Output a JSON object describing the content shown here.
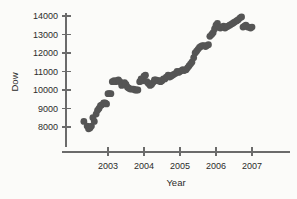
{
  "chart_data": {
    "type": "scatter",
    "title": "",
    "xlabel": "Year",
    "ylabel": "Dow",
    "xlim": [
      2002.25,
      2007.15
    ],
    "ylim": [
      7400,
      14350
    ],
    "grid": false,
    "legend": "none",
    "marker": {
      "shape": "circle",
      "color": "#555555",
      "size": 3.4
    },
    "xticks": [
      2003,
      2004,
      2005,
      2006,
      2007
    ],
    "xtick_labels": [
      "2003",
      "2004",
      "2005",
      "2006",
      "2007"
    ],
    "yticks": [
      8000,
      9000,
      10000,
      11000,
      12000,
      13000,
      14000
    ],
    "ytick_labels": [
      "8000",
      "9000",
      "10000",
      "11000",
      "12000",
      "13000",
      "14000"
    ],
    "series": [
      {
        "name": "Dow Jones monthly close",
        "x": [
          2002.33,
          2002.42,
          2002.46,
          2002.5,
          2002.54,
          2002.58,
          2002.62,
          2002.67,
          2002.71,
          2002.75,
          2002.79,
          2002.83,
          2002.88,
          2002.92,
          2002.96,
          2003.0,
          2003.04,
          2003.08,
          2003.12,
          2003.17,
          2003.21,
          2003.25,
          2003.29,
          2003.33,
          2003.38,
          2003.42,
          2003.46,
          2003.5,
          2003.54,
          2003.58,
          2003.62,
          2003.67,
          2003.71,
          2003.75,
          2003.79,
          2003.83,
          2003.88,
          2003.92,
          2003.96,
          2004.0,
          2004.04,
          2004.08,
          2004.12,
          2004.17,
          2004.21,
          2004.25,
          2004.29,
          2004.33,
          2004.38,
          2004.42,
          2004.46,
          2004.5,
          2004.54,
          2004.58,
          2004.62,
          2004.67,
          2004.71,
          2004.75,
          2004.79,
          2004.83,
          2004.88,
          2004.92,
          2004.96,
          2005.0,
          2005.04,
          2005.08,
          2005.12,
          2005.17,
          2005.21,
          2005.25,
          2005.29,
          2005.33,
          2005.38,
          2005.42,
          2005.46,
          2005.5,
          2005.54,
          2005.58,
          2005.62,
          2005.67,
          2005.71,
          2005.75,
          2005.79,
          2005.83,
          2005.88,
          2005.92,
          2005.96,
          2006.0,
          2006.04,
          2006.08,
          2006.12,
          2006.17,
          2006.21,
          2006.25,
          2006.29,
          2006.33,
          2006.38,
          2006.42,
          2006.46,
          2006.5,
          2006.54,
          2006.58,
          2006.62,
          2006.67,
          2006.71,
          2006.75,
          2006.79,
          2006.83,
          2006.88,
          2006.92,
          2006.96,
          2007.0
        ],
        "y": [
          8300,
          8050,
          7900,
          7950,
          8050,
          8500,
          8300,
          8700,
          8900,
          9000,
          9150,
          9200,
          9300,
          9300,
          9250,
          9800,
          9800,
          9800,
          10450,
          10500,
          10450,
          10500,
          10550,
          10450,
          10250,
          10300,
          10400,
          10300,
          10150,
          10100,
          10050,
          10050,
          10050,
          10000,
          10000,
          10000,
          10450,
          10600,
          10500,
          10750,
          10800,
          10450,
          10350,
          10250,
          10300,
          10400,
          10550,
          10550,
          10500,
          10500,
          10450,
          10500,
          10600,
          10600,
          10700,
          10800,
          10700,
          10750,
          10800,
          10850,
          10900,
          11000,
          10950,
          11000,
          11050,
          11100,
          11050,
          11100,
          11200,
          11300,
          11400,
          11500,
          11750,
          12000,
          12100,
          12200,
          12300,
          12350,
          12400,
          12400,
          12350,
          12400,
          12450,
          12900,
          13000,
          13100,
          13300,
          13500,
          13600,
          13400,
          13350,
          13400,
          13450,
          13350,
          13400,
          13450,
          13500,
          13550,
          13600,
          13650,
          13700,
          13750,
          13800,
          13900,
          13950,
          13400,
          13450,
          13500,
          13400,
          13400,
          13350,
          13400
        ]
      }
    ]
  },
  "axes": {
    "y_title": "Dow",
    "x_title": "Year"
  }
}
